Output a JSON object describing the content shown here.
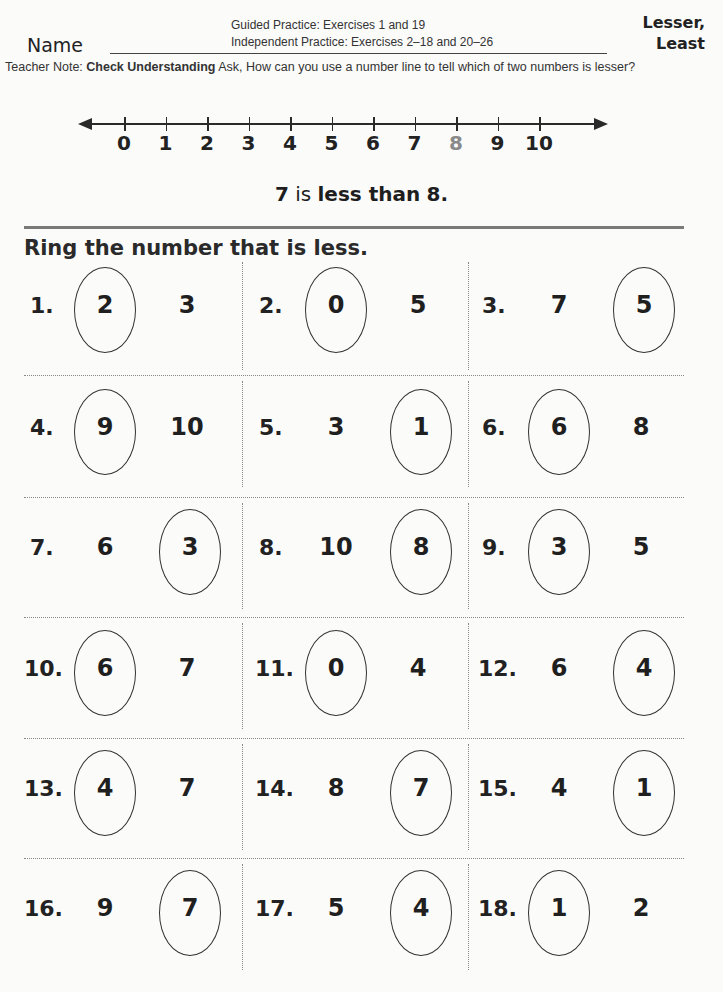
{
  "header": {
    "guided_practice": "Guided Practice: Exercises 1 and 19",
    "independent_practice": "Independent Practice: Exercises 2–18 and 20–26",
    "name_label": "Name",
    "lesson_title_line1": "Lesser,",
    "lesson_title_line2": "Least"
  },
  "teacher_note": {
    "prefix": "Teacher Note: ",
    "bold": "Check Understanding",
    "text": " Ask, How can you use a number line to tell which of two numbers is lesser?"
  },
  "number_line": {
    "labels": [
      "0",
      "1",
      "2",
      "3",
      "4",
      "5",
      "6",
      "7",
      "8",
      "9",
      "10"
    ],
    "highlighted": "8",
    "highlight_color": "#8a8a8a"
  },
  "statement": {
    "a": "7",
    "middle": " is ",
    "less_than": "less than",
    "b": "8",
    "end": "."
  },
  "instruction": "Ring the number that is less.",
  "exercises": [
    {
      "number": "1.",
      "left": "2",
      "right": "3",
      "ringed": "left"
    },
    {
      "number": "2.",
      "left": "0",
      "right": "5",
      "ringed": "left"
    },
    {
      "number": "3.",
      "left": "7",
      "right": "5",
      "ringed": "right"
    },
    {
      "number": "4.",
      "left": "9",
      "right": "10",
      "ringed": "left"
    },
    {
      "number": "5.",
      "left": "3",
      "right": "1",
      "ringed": "right"
    },
    {
      "number": "6.",
      "left": "6",
      "right": "8",
      "ringed": "left"
    },
    {
      "number": "7.",
      "left": "6",
      "right": "3",
      "ringed": "right"
    },
    {
      "number": "8.",
      "left": "10",
      "right": "8",
      "ringed": "right"
    },
    {
      "number": "9.",
      "left": "3",
      "right": "5",
      "ringed": "left"
    },
    {
      "number": "10.",
      "left": "6",
      "right": "7",
      "ringed": "left"
    },
    {
      "number": "11.",
      "left": "0",
      "right": "4",
      "ringed": "left"
    },
    {
      "number": "12.",
      "left": "6",
      "right": "4",
      "ringed": "right"
    },
    {
      "number": "13.",
      "left": "4",
      "right": "7",
      "ringed": "left"
    },
    {
      "number": "14.",
      "left": "8",
      "right": "7",
      "ringed": "right"
    },
    {
      "number": "15.",
      "left": "4",
      "right": "1",
      "ringed": "right"
    },
    {
      "number": "16.",
      "left": "9",
      "right": "7",
      "ringed": "right"
    },
    {
      "number": "17.",
      "left": "5",
      "right": "4",
      "ringed": "right"
    },
    {
      "number": "18.",
      "left": "1",
      "right": "2",
      "ringed": "left"
    }
  ]
}
